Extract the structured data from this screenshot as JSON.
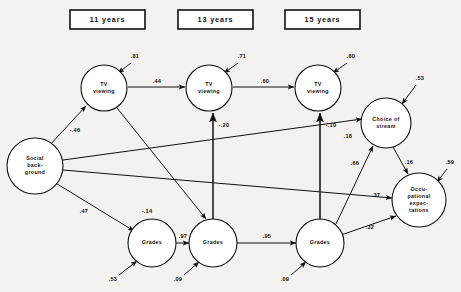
{
  "figure": {
    "type": "path-diagram",
    "background_color": "#f3f2f0",
    "ink_color": "#111111"
  },
  "era_headers": [
    {
      "label": "11 years",
      "x": 70,
      "y": 10,
      "w": 75,
      "h": 19
    },
    {
      "label": "13 years",
      "x": 178,
      "y": 10,
      "w": 75,
      "h": 19
    },
    {
      "label": "15 years",
      "x": 285,
      "y": 10,
      "w": 75,
      "h": 19
    }
  ],
  "nodes": [
    {
      "id": "social",
      "lines": [
        "Social",
        "back-",
        "ground"
      ],
      "cx": 35,
      "cy": 166,
      "r": 28
    },
    {
      "id": "tv11",
      "lines": [
        "TV",
        "viewing"
      ],
      "cx": 104,
      "cy": 88,
      "r": 23
    },
    {
      "id": "tv13",
      "lines": [
        "TV",
        "viewing"
      ],
      "cx": 209,
      "cy": 88,
      "r": 23
    },
    {
      "id": "tv15",
      "lines": [
        "TV",
        "viewing"
      ],
      "cx": 318,
      "cy": 88,
      "r": 23
    },
    {
      "id": "choice",
      "lines": [
        "Choice of",
        "stream"
      ],
      "cx": 386,
      "cy": 123,
      "r": 25
    },
    {
      "id": "occup",
      "lines": [
        "Occu-",
        "pational",
        "expec-",
        "tations"
      ],
      "cx": 419,
      "cy": 200,
      "r": 27
    },
    {
      "id": "grades11",
      "lines": [
        "Grades"
      ],
      "cx": 152,
      "cy": 243,
      "r": 24
    },
    {
      "id": "grades13",
      "lines": [
        "Grades"
      ],
      "cx": 213,
      "cy": 243,
      "r": 24
    },
    {
      "id": "grades15",
      "lines": [
        "Grades"
      ],
      "cx": 320,
      "cy": 243,
      "r": 24
    }
  ],
  "paths": [
    {
      "id": "tv11-tv13",
      "coef": ".44",
      "from": "tv11",
      "to": "tv13",
      "label_x": 157,
      "label_y": 82,
      "x1": 128,
      "y1": 87,
      "x2": 185,
      "y2": 87
    },
    {
      "id": "tv13-tv15",
      "coef": ".60",
      "from": "tv13",
      "to": "tv15",
      "label_x": 265,
      "label_y": 82,
      "x1": 233,
      "y1": 87,
      "x2": 294,
      "y2": 87
    },
    {
      "id": "social-tv11",
      "coef": "-.46",
      "from": "social",
      "to": "tv11",
      "label_x": 75,
      "label_y": 131,
      "x1": 48,
      "y1": 147,
      "x2": 86,
      "y2": 106
    },
    {
      "id": "social-grades11",
      "coef": ".47",
      "from": "social",
      "to": "grades11",
      "label_x": 84,
      "label_y": 212,
      "x1": 54,
      "y1": 182,
      "x2": 134,
      "y2": 231
    },
    {
      "id": "social-choice",
      "coef": "",
      "from": "social",
      "to": "choice",
      "label_x": 0,
      "label_y": 0,
      "x1": 63,
      "y1": 160,
      "x2": 362,
      "y2": 119
    },
    {
      "id": "social-occup",
      "coef": "",
      "from": "social",
      "to": "occup",
      "label_x": 0,
      "label_y": 0,
      "x1": 63,
      "y1": 170,
      "x2": 392,
      "y2": 198
    },
    {
      "id": "tv11-grades13",
      "coef": "-.14",
      "from": "tv11",
      "to": "grades13",
      "label_x": 147,
      "label_y": 212,
      "x1": 117,
      "y1": 108,
      "x2": 206,
      "y2": 219
    },
    {
      "id": "grades13-tv13",
      "coef": "-.20",
      "from": "grades13",
      "to": "tv13",
      "label_x": 224,
      "label_y": 126,
      "x1": 213,
      "y1": 219,
      "x2": 213,
      "y2": 113
    },
    {
      "id": "grades15-tv15",
      "coef": "-.10",
      "from": "grades15",
      "to": "tv15",
      "label_x": 331,
      "label_y": 126,
      "x1": 320,
      "y1": 219,
      "x2": 320,
      "y2": 113
    },
    {
      "id": "grades11-grades13",
      "coef": ".97",
      "from": "grades11",
      "to": "grades13",
      "label_x": 183,
      "label_y": 237,
      "x1": 176,
      "y1": 243,
      "x2": 189,
      "y2": 243
    },
    {
      "id": "grades13-grades15",
      "coef": ".95",
      "from": "grades13",
      "to": "grades15",
      "label_x": 267,
      "label_y": 237,
      "x1": 237,
      "y1": 243,
      "x2": 296,
      "y2": 243
    },
    {
      "id": "choice-tv15arrow",
      "coef": ".18",
      "from": "social",
      "to": "choice",
      "label_x": 348,
      "label_y": 137,
      "x1": 0,
      "y1": 0,
      "x2": 0,
      "y2": 0
    },
    {
      "id": "grades15-choice",
      "coef": ".66",
      "from": "grades15",
      "to": "choice",
      "label_x": 355,
      "label_y": 164,
      "x1": 336,
      "y1": 224,
      "x2": 373,
      "y2": 146
    },
    {
      "id": "choice-occup",
      "coef": ".16",
      "from": "choice",
      "to": "occup",
      "label_x": 409,
      "label_y": 163,
      "x1": 393,
      "y1": 147,
      "x2": 408,
      "y2": 174
    },
    {
      "id": "socialoccup-lbl",
      "coef": ".37",
      "from": "social",
      "to": "occup",
      "label_x": 376,
      "label_y": 196,
      "x1": 0,
      "y1": 0,
      "x2": 0,
      "y2": 0
    },
    {
      "id": "grades15-occup",
      "coef": ".32",
      "from": "grades15",
      "to": "occup",
      "label_x": 370,
      "label_y": 228,
      "x1": 341,
      "y1": 235,
      "x2": 396,
      "y2": 216
    }
  ],
  "residuals": [
    {
      "id": "res-tv11",
      "coef": ".81",
      "label_x": 135,
      "label_y": 57,
      "x1": 131,
      "y1": 63,
      "x2": 118,
      "y2": 73
    },
    {
      "id": "res-tv13",
      "coef": ".71",
      "label_x": 242,
      "label_y": 57,
      "x1": 238,
      "y1": 63,
      "x2": 224,
      "y2": 73
    },
    {
      "id": "res-tv15",
      "coef": ".60",
      "label_x": 351,
      "label_y": 57,
      "x1": 347,
      "y1": 63,
      "x2": 333,
      "y2": 73
    },
    {
      "id": "res-choice",
      "coef": ".53",
      "label_x": 420,
      "label_y": 79,
      "x1": 416,
      "y1": 85,
      "x2": 402,
      "y2": 104
    },
    {
      "id": "res-occup",
      "coef": ".59",
      "label_x": 450,
      "label_y": 163,
      "x1": 447,
      "y1": 169,
      "x2": 437,
      "y2": 182
    },
    {
      "id": "res-grades11",
      "coef": ".53",
      "label_x": 113,
      "label_y": 280,
      "x1": 119,
      "y1": 275,
      "x2": 137,
      "y2": 261
    },
    {
      "id": "res-grades13",
      "coef": ".09",
      "label_x": 178,
      "label_y": 280,
      "x1": 184,
      "y1": 275,
      "x2": 199,
      "y2": 262
    },
    {
      "id": "res-grades15",
      "coef": ".09",
      "label_x": 285,
      "label_y": 280,
      "x1": 291,
      "y1": 275,
      "x2": 306,
      "y2": 262
    }
  ]
}
